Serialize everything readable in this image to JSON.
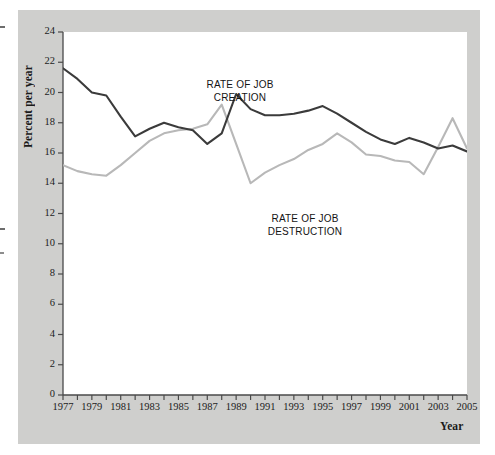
{
  "figure": {
    "background_color": "#cfcfcd",
    "plot_background_color": "#ffffff"
  },
  "axis": {
    "ylabel": "Percent per year",
    "xlabel": "Year",
    "yticks": [
      "0",
      "2",
      "4",
      "6",
      "8",
      "10",
      "12",
      "14",
      "16",
      "18",
      "20",
      "22",
      "24"
    ],
    "xticks": [
      "1977",
      "1979",
      "1981",
      "1983",
      "1985",
      "1987",
      "1989",
      "1991",
      "1993",
      "1995",
      "1997",
      "1999",
      "2001",
      "2003",
      "2005"
    ]
  },
  "annotations": {
    "creation": "RATE OF JOB\nCREATION",
    "destruction": "RATE OF JOB\nDESTRUCTION"
  },
  "chart_data": {
    "type": "line",
    "title": "",
    "xlabel": "Year",
    "ylabel": "Percent per year",
    "xlim": [
      1977,
      2005
    ],
    "ylim": [
      0,
      24
    ],
    "ytick_step": 2,
    "xtick_step": 1,
    "xtick_label_step": 2,
    "grid": false,
    "legend": "inline-annotations",
    "x": [
      1977,
      1978,
      1979,
      1980,
      1981,
      1982,
      1983,
      1984,
      1985,
      1986,
      1987,
      1988,
      1989,
      1990,
      1991,
      1992,
      1993,
      1994,
      1995,
      1996,
      1997,
      1998,
      1999,
      2000,
      2001,
      2002,
      2003,
      2004,
      2005
    ],
    "series": [
      {
        "name": "RATE OF JOB CREATION",
        "color": "#3b3b3b",
        "values": [
          21.6,
          20.9,
          20.0,
          19.8,
          18.4,
          17.1,
          17.6,
          18.0,
          17.7,
          17.5,
          16.6,
          17.3,
          19.9,
          18.9,
          18.5,
          18.5,
          18.6,
          18.8,
          19.1,
          18.6,
          18.0,
          17.4,
          16.9,
          16.6,
          17.0,
          16.7,
          16.3,
          16.5,
          16.1
        ]
      },
      {
        "name": "RATE OF JOB DESTRUCTION",
        "color": "#b8b8b8",
        "values": [
          15.2,
          14.8,
          14.6,
          14.5,
          15.2,
          16.0,
          16.8,
          17.3,
          17.5,
          17.6,
          17.9,
          19.2,
          16.6,
          14.0,
          14.7,
          15.2,
          15.6,
          16.2,
          16.6,
          17.3,
          16.7,
          15.9,
          15.8,
          15.5,
          15.4,
          14.6,
          16.4,
          18.3,
          16.3
        ]
      }
    ],
    "series_extra_points": [
      {
        "note": "dark line dips near 1987-1988 and rises sharply to 1989 peak of 19.9"
      },
      {
        "note": "light line peaks near 1988 at 19.2, then drops to 14.0 near 1990"
      }
    ]
  }
}
